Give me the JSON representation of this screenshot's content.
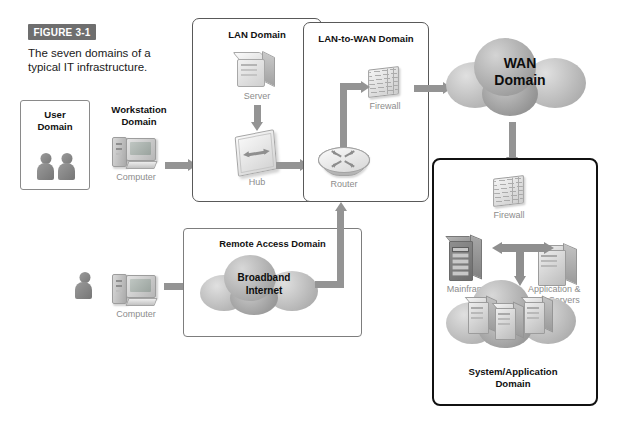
{
  "figure": {
    "badge": "FIGURE 3-1",
    "caption": "The seven domains of a typical IT infrastructure."
  },
  "domains": {
    "user": {
      "title": "User\nDomain",
      "line1": "User",
      "line2": "Domain"
    },
    "workstation": {
      "line1": "Workstation",
      "line2": "Domain",
      "device_label": "Computer"
    },
    "lan": {
      "title": "LAN Domain",
      "server_label": "Server",
      "hub_label": "Hub"
    },
    "lan_to_wan": {
      "title": "LAN-to-WAN Domain",
      "firewall_label": "Firewall",
      "router_label": "Router"
    },
    "wan": {
      "line1": "WAN",
      "line2": "Domain"
    },
    "remote_access": {
      "title": "Remote Access Domain",
      "cloud_line1": "Broadband",
      "cloud_line2": "Internet",
      "device_label": "Computer"
    },
    "system_application": {
      "line1": "System/Application",
      "line2": "Domain",
      "firewall_label": "Firewall",
      "mainframe_label": "Mainframe",
      "servers_line1": "Application &",
      "servers_line2": "Web Servers"
    }
  },
  "colors": {
    "badge_bg": "#6e6e6e",
    "badge_text": "#ffffff",
    "box_border": "#595959",
    "thick_border": "#111111",
    "arrow": "#949494",
    "icon_gray": "#a8a8a8"
  }
}
